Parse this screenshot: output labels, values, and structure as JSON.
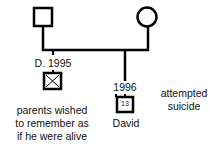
{
  "pedigree": {
    "father": {
      "symbol": "square",
      "status": "living"
    },
    "mother": {
      "symbol": "circle",
      "status": "living"
    },
    "children": [
      {
        "symbol": "square-crossed",
        "label": "D. 1995",
        "note_lines": [
          "parents wished",
          "to remember as",
          "if he were alive"
        ]
      },
      {
        "symbol": "square-numbered",
        "year": "1996",
        "age": "13",
        "name": "David",
        "note_lines": [
          "attempted",
          "suicide"
        ]
      }
    ]
  }
}
